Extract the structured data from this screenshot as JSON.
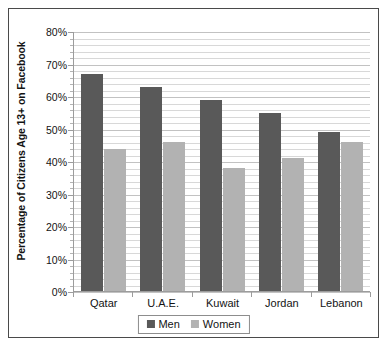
{
  "chart_data": {
    "type": "bar",
    "title": "",
    "xlabel": "",
    "ylabel": "Percentage of Citizens Age 13+ on Facebook",
    "categories": [
      "Qatar",
      "U.A.E.",
      "Kuwait",
      "Jordan",
      "Lebanon"
    ],
    "series": [
      {
        "name": "Men",
        "color": "#595959",
        "values": [
          67,
          63,
          59,
          55,
          49
        ]
      },
      {
        "name": "Women",
        "color": "#b2b2b2",
        "values": [
          44,
          46,
          38,
          41,
          46
        ]
      }
    ],
    "ylim": [
      0,
      80
    ],
    "ytick_labels": [
      "0%",
      "10%",
      "20%",
      "30%",
      "40%",
      "50%",
      "60%",
      "70%",
      "80%"
    ],
    "ytick_values": [
      0,
      10,
      20,
      30,
      40,
      50,
      60,
      70,
      80
    ],
    "grid": "horizontal-major-and-minor",
    "minor_tick_step": 2,
    "legend_position": "bottom",
    "legend": [
      "Men",
      "Women"
    ]
  },
  "axis": {
    "y_title": "Percentage of Citizens Age 13+ on Facebook"
  },
  "legend": {
    "items": [
      {
        "label": "Men"
      },
      {
        "label": "Women"
      }
    ]
  },
  "icons": {
    "men_swatch": "square-swatch-icon",
    "women_swatch": "square-swatch-icon"
  }
}
